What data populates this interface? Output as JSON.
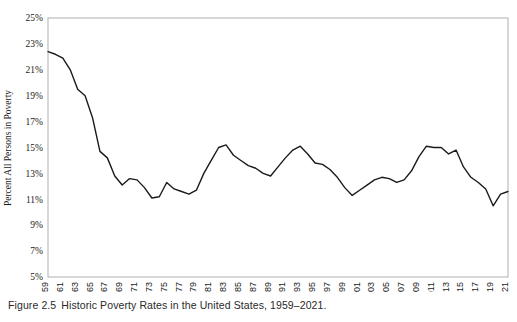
{
  "caption": {
    "label": "Figure 2.5",
    "text": "Historic Poverty Rates in the United States, 1959–2021."
  },
  "colors": {
    "line": "#1a1a1a",
    "plot_border": "#b0b0b0",
    "text": "#1a1a1a",
    "background": "#ffffff"
  },
  "chart_data": {
    "type": "line",
    "title": "",
    "subtitle": "",
    "xlabel": "",
    "ylabel": "Percent All Persons in Poverty",
    "ylim": [
      5,
      25
    ],
    "xlim": [
      1959,
      2021
    ],
    "yticks": [
      "5%",
      "7%",
      "9%",
      "11%",
      "13%",
      "15%",
      "17%",
      "19%",
      "21%",
      "23%",
      "25%"
    ],
    "ytick_values": [
      5,
      7,
      9,
      11,
      13,
      15,
      17,
      19,
      21,
      23,
      25
    ],
    "ytick_suffix": "%",
    "xticks": [
      "1959",
      "1961",
      "1963",
      "1965",
      "1967",
      "1969",
      "1971",
      "1973",
      "1975",
      "1977",
      "1979",
      "1981",
      "1983",
      "1985",
      "1987",
      "1989",
      "1991",
      "1993",
      "1995",
      "1997",
      "1999",
      "2001",
      "2003",
      "2005",
      "2007",
      "2009",
      "2011",
      "2013",
      "2015",
      "2017",
      "2019",
      "2021"
    ],
    "xtick_rotation": 90,
    "grid": false,
    "legend": false,
    "legend_position": "none",
    "series": [
      {
        "name": "Percent All Persons in Poverty",
        "x": [
          1959,
          1960,
          1961,
          1962,
          1963,
          1964,
          1965,
          1966,
          1967,
          1968,
          1969,
          1970,
          1971,
          1972,
          1973,
          1974,
          1975,
          1976,
          1977,
          1978,
          1979,
          1980,
          1981,
          1982,
          1983,
          1984,
          1985,
          1986,
          1987,
          1988,
          1989,
          1990,
          1991,
          1992,
          1993,
          1994,
          1995,
          1996,
          1997,
          1998,
          1999,
          2000,
          2001,
          2002,
          2003,
          2004,
          2005,
          2006,
          2007,
          2008,
          2009,
          2010,
          2011,
          2012,
          2013,
          2014,
          2015,
          2016,
          2017,
          2018,
          2019,
          2020,
          2021
        ],
        "values": [
          22.4,
          22.2,
          21.9,
          21.0,
          19.5,
          19.0,
          17.3,
          14.7,
          14.2,
          12.8,
          12.1,
          12.6,
          12.5,
          11.9,
          11.1,
          11.2,
          12.3,
          11.8,
          11.6,
          11.4,
          11.7,
          13.0,
          14.0,
          15.0,
          15.2,
          14.4,
          14.0,
          13.6,
          13.4,
          13.0,
          12.8,
          13.5,
          14.2,
          14.8,
          15.1,
          14.5,
          13.8,
          13.7,
          13.3,
          12.7,
          11.9,
          11.3,
          11.7,
          12.1,
          12.5,
          12.7,
          12.6,
          12.3,
          12.5,
          13.2,
          14.3,
          15.1,
          15.0,
          15.0,
          14.5,
          14.8,
          13.5,
          12.7,
          12.3,
          11.8,
          10.5,
          11.4,
          11.6
        ]
      }
    ]
  }
}
